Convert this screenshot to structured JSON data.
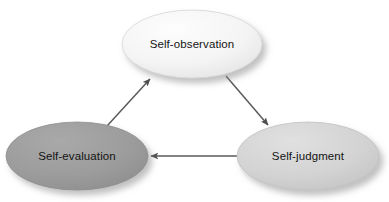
{
  "diagram": {
    "background_color": "#ffffff",
    "width": 389,
    "height": 202,
    "nodes": [
      {
        "id": "self-observation",
        "label": "Self-observation",
        "cx": 192,
        "cy": 44,
        "rx": 70,
        "ry": 34,
        "fill": "#f2f2f2",
        "fill_light": "#fbfbfb",
        "stroke": "#cfcfcf"
      },
      {
        "id": "self-evaluation",
        "label": "Self-evaluation",
        "cx": 77,
        "cy": 156,
        "rx": 71,
        "ry": 34,
        "fill": "#9b9b9b",
        "fill_light": "#a8a8a8",
        "stroke": "#8a8a8a"
      },
      {
        "id": "self-judgment",
        "label": "Self-judgment",
        "cx": 308,
        "cy": 156,
        "rx": 71,
        "ry": 34,
        "fill": "#d2d2d2",
        "fill_light": "#dedede",
        "stroke": "#bdbdbd"
      }
    ],
    "edges": [
      {
        "id": "observation-to-judgment",
        "from": "self-observation",
        "to": "self-judgment",
        "x1": 226,
        "y1": 76,
        "x2": 268,
        "y2": 125,
        "color": "#5a5a5a"
      },
      {
        "id": "judgment-to-evaluation",
        "from": "self-judgment",
        "to": "self-evaluation",
        "x1": 240,
        "y1": 156,
        "x2": 150,
        "y2": 156,
        "color": "#5a5a5a"
      },
      {
        "id": "evaluation-to-observation",
        "from": "self-evaluation",
        "to": "self-observation",
        "x1": 107,
        "y1": 126,
        "x2": 150,
        "y2": 79,
        "color": "#5a5a5a"
      }
    ]
  }
}
